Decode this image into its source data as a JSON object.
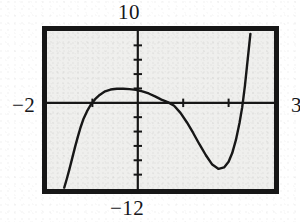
{
  "figure": {
    "kind": "graphing-calculator-screen",
    "ink_color": "#171717",
    "screen_color": "#f3f3f1",
    "bezel_color": "#171717"
  },
  "labels": {
    "ymax": "10",
    "ymin": "−12",
    "xmin": "−2",
    "xmax": "3"
  },
  "chart_data": {
    "type": "line",
    "title": "",
    "xlabel": "",
    "ylabel": "",
    "xlim": [
      -2,
      3
    ],
    "ylim": [
      -12,
      10
    ],
    "grid": false,
    "legend": null,
    "axes": {
      "x_axis_y": 0,
      "y_axis_x": 0,
      "x_tick_interval": 1,
      "y_tick_interval": 2,
      "x_ticks": [
        -1,
        1,
        2
      ],
      "y_ticks": [
        -10,
        -8,
        -6,
        -4,
        -2,
        2,
        4,
        6,
        8
      ]
    },
    "features": {
      "x_intercepts": [
        -1.35,
        0.75,
        2.3
      ],
      "local_maximum": {
        "x": -0.4,
        "y": 1.9
      },
      "local_minimum": {
        "x": 1.75,
        "y": -9.2
      }
    },
    "series": [
      {
        "name": "y",
        "x": [
          -1.62,
          -1.56,
          -1.5,
          -1.44,
          -1.38,
          -1.32,
          -1.26,
          -1.2,
          -1.12,
          -1.04,
          -0.94,
          -0.84,
          -0.72,
          -0.6,
          -0.46,
          -0.32,
          -0.18,
          -0.04,
          0.1,
          0.24,
          0.38,
          0.52,
          0.66,
          0.8,
          0.94,
          1.08,
          1.22,
          1.36,
          1.5,
          1.64,
          1.78,
          1.9,
          2.0,
          2.08,
          2.16,
          2.24,
          2.3,
          2.36,
          2.42,
          2.48
        ],
        "y": [
          -11.8,
          -10.5,
          -9.1,
          -7.6,
          -6.1,
          -4.7,
          -3.4,
          -2.3,
          -1.2,
          -0.3,
          0.5,
          1.1,
          1.6,
          1.85,
          1.95,
          1.95,
          1.9,
          1.8,
          1.6,
          1.3,
          0.9,
          0.45,
          0.1,
          -0.4,
          -1.4,
          -2.7,
          -4.2,
          -5.8,
          -7.3,
          -8.6,
          -9.2,
          -9.0,
          -8.2,
          -7.0,
          -5.2,
          -2.8,
          -0.6,
          2.4,
          6.0,
          9.6
        ]
      }
    ]
  }
}
